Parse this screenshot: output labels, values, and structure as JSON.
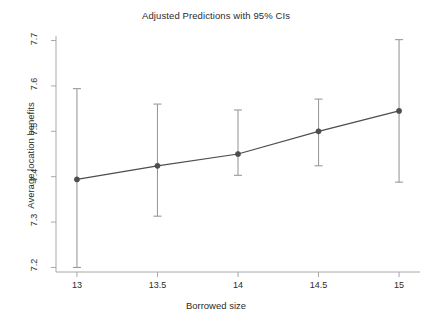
{
  "chart_data": {
    "type": "line",
    "title": "Adjusted Predictions with 95% CIs",
    "xlabel": "Borrowed size",
    "ylabel": "Average location benefits",
    "x": [
      13,
      13.5,
      14,
      14.5,
      15
    ],
    "values": [
      7.394,
      7.424,
      7.45,
      7.5,
      7.545
    ],
    "ci_lower": [
      7.2,
      7.313,
      7.403,
      7.424,
      7.388
    ],
    "ci_upper": [
      7.594,
      7.56,
      7.547,
      7.571,
      7.702
    ],
    "xtick_labels": [
      "13",
      "13.5",
      "14",
      "14.5",
      "15"
    ],
    "ytick_labels": [
      "7.2",
      "7.3",
      "7.4",
      "7.5",
      "7.6",
      "7.7"
    ],
    "xticks": [
      13,
      13.5,
      14,
      14.5,
      15
    ],
    "yticks": [
      7.2,
      7.3,
      7.4,
      7.5,
      7.6,
      7.7
    ],
    "xlim": [
      12.87,
      15.13
    ],
    "ylim": [
      7.19,
      7.71
    ],
    "grid": false,
    "legend": "none",
    "series_name": "Linear prediction",
    "marker": "circle",
    "line_color": "#4d4d4d",
    "marker_color": "#4d4d4d",
    "error_bar_color": "#9a9a9a",
    "axis_color": "#a8a8a8",
    "text_color": "#2b2b2b",
    "background_color": "#ffffff"
  }
}
